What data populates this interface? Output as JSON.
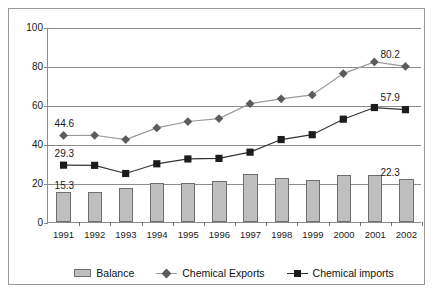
{
  "chart_data": {
    "type": "bar",
    "title": "",
    "subtitle": "",
    "xlabel": "",
    "ylabel": "",
    "categories": [
      "1991",
      "1992",
      "1993",
      "1994",
      "1995",
      "1996",
      "1997",
      "1998",
      "1999",
      "2000",
      "2001",
      "2002"
    ],
    "ylim": [
      0,
      100
    ],
    "yticks": [
      0,
      20,
      40,
      60,
      80,
      100
    ],
    "ytick_labels": [
      "0",
      "20",
      "40",
      "60",
      "80",
      "100"
    ],
    "grid": true,
    "legend_position": "bottom",
    "series": [
      {
        "name": "Balance",
        "type": "bar",
        "color": "#bfbfbf",
        "edge_color": "#6e6e6e",
        "values": [
          15.3,
          15.5,
          17.5,
          19.8,
          19.8,
          21.0,
          24.5,
          22.5,
          21.5,
          24.0,
          24.0,
          22.3
        ]
      },
      {
        "name": "Chemical Exports",
        "type": "line",
        "marker": "diamond",
        "color": "#5c5c5c",
        "line_color": "#9a9a9a",
        "values": [
          44.6,
          44.7,
          42.5,
          48.5,
          51.8,
          53.3,
          61.0,
          63.5,
          65.5,
          76.5,
          82.5,
          80.2
        ]
      },
      {
        "name": "Chemical imports",
        "type": "line",
        "marker": "square",
        "color": "#1c1c1c",
        "line_color": "#333333",
        "values": [
          29.3,
          29.2,
          25.0,
          30.0,
          32.5,
          32.8,
          36.0,
          42.5,
          45.0,
          53.0,
          59.0,
          57.9
        ]
      }
    ],
    "annotations": [
      {
        "text": "44.6",
        "series": "Chemical Exports",
        "category": "1991",
        "value": 44.6
      },
      {
        "text": "29.3",
        "series": "Chemical imports",
        "category": "1991",
        "value": 29.3
      },
      {
        "text": "15.3",
        "series": "Balance",
        "category": "1991",
        "value": 15.3
      },
      {
        "text": "80.2",
        "series": "Chemical Exports",
        "category": "2002",
        "value": 80.2
      },
      {
        "text": "57.9",
        "series": "Chemical imports",
        "category": "2002",
        "value": 57.9
      },
      {
        "text": "22.3",
        "series": "Balance",
        "category": "2002",
        "value": 22.3
      }
    ]
  },
  "legend": {
    "items": [
      {
        "label": "Balance",
        "marker": "bar-swatch"
      },
      {
        "label": "Chemical Exports",
        "marker": "diamond-marker"
      },
      {
        "label": "Chemical imports",
        "marker": "square-marker"
      }
    ]
  }
}
